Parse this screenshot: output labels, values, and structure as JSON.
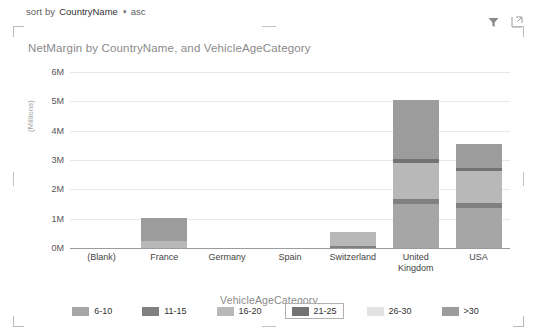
{
  "sortbar": {
    "prefix": "sort by",
    "field": "CountryName",
    "caret_icon": "chevron-down-icon",
    "direction": "asc"
  },
  "header_icons": {
    "filter": "filter-icon",
    "focus": "focus-mode-icon"
  },
  "chart_data": {
    "type": "bar",
    "stacked": true,
    "title": "NetMargin by CountryName, and VehicleAgeCategory",
    "xlabel": "VehicleAgeCategory",
    "ylabel": "(Millions)",
    "ylim": [
      0,
      6000000
    ],
    "ytick_labels": [
      "0M",
      "1M",
      "2M",
      "3M",
      "4M",
      "5M",
      "6M"
    ],
    "ytick_values": [
      0,
      1000000,
      2000000,
      3000000,
      4000000,
      5000000,
      6000000
    ],
    "grid": true,
    "legend_position": "bottom",
    "categories": [
      "(Blank)",
      "France",
      "Germany",
      "Spain",
      "Switzerland",
      "United\nKingdom",
      "USA"
    ],
    "series": [
      {
        "name": "6-10",
        "color": "#a6a6a6",
        "values": [
          0,
          0,
          0,
          0,
          0,
          1500000,
          1350000
        ]
      },
      {
        "name": "11-15",
        "color": "#808080",
        "values": [
          0,
          0,
          0,
          0,
          80000,
          180000,
          170000
        ]
      },
      {
        "name": "16-20",
        "color": "#b8b8b8",
        "values": [
          0,
          250000,
          0,
          0,
          470000,
          1220000,
          1100000
        ]
      },
      {
        "name": "21-25",
        "color": "#737373",
        "values": [
          0,
          0,
          0,
          0,
          0,
          130000,
          120000
        ]
      },
      {
        "name": "26-30",
        "color": "#e2e2e2",
        "values": [
          0,
          0,
          0,
          0,
          0,
          0,
          0
        ]
      },
      {
        "name": ">30",
        "color": "#9c9c9c",
        "values": [
          0,
          760000,
          0,
          0,
          0,
          2010000,
          820000
        ]
      }
    ],
    "totals": [
      0,
      1010000,
      0,
      0,
      550000,
      5040000,
      3560000
    ],
    "legend": [
      {
        "label": "6-10",
        "color": "#a6a6a6",
        "selected": false
      },
      {
        "label": "11-15",
        "color": "#808080",
        "selected": false
      },
      {
        "label": "16-20",
        "color": "#b8b8b8",
        "selected": false
      },
      {
        "label": "21-25",
        "color": "#737373",
        "selected": true
      },
      {
        "label": "26-30",
        "color": "#e2e2e2",
        "selected": false
      },
      {
        "label": ">30",
        "color": "#9c9c9c",
        "selected": false
      }
    ]
  }
}
